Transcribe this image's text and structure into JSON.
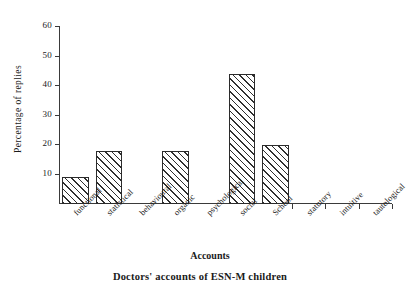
{
  "chart_data": {
    "type": "bar",
    "title": "",
    "xlabel": "Accounts",
    "ylabel": "Percentage of replies",
    "categories": [
      "functional",
      "statistical",
      "behavioural",
      "organic",
      "psychological",
      "social",
      "School",
      "statutory",
      "intuitive",
      "tautological"
    ],
    "values": [
      9,
      18,
      0,
      18,
      0,
      44,
      20,
      0,
      0,
      0
    ],
    "ylim": [
      0,
      60
    ],
    "yticks": [
      10,
      20,
      30,
      40,
      50,
      60
    ],
    "ytick_labels": [
      "10",
      "20",
      "30",
      "40",
      "50",
      "60"
    ],
    "grid": false,
    "legend": null,
    "bar_fill": "diagonal-hatch",
    "caption": "Doctors' accounts of ESN-M children",
    "axis_color": "#3a3a3a",
    "bar_edge_color": "#2b2b2b",
    "hatch_color": "#2f2f2f"
  },
  "figure": {
    "y_axis_title": "Percentage of replies",
    "x_axis_title": "Accounts",
    "caption": "Doctors' accounts of ESN-M children"
  }
}
